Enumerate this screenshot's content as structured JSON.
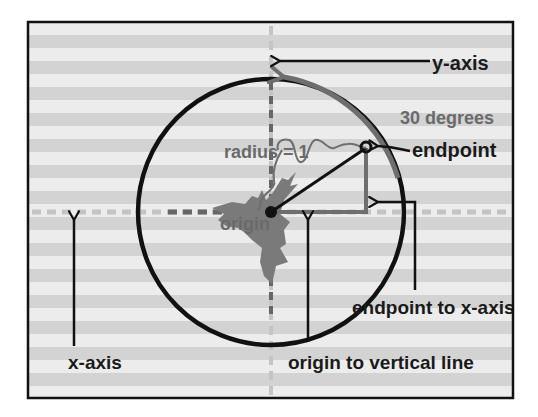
{
  "diagram": {
    "colors": {
      "stripe_light": "#ececec",
      "stripe_dark": "#d3d3d3",
      "border": "#111111",
      "circle": "#111111",
      "accent_gray": "#6e6e6e",
      "axis_dash_light": "#c4c4c4",
      "label_dark": "#1a1a1a",
      "label_gray": "#6a6a6a"
    },
    "angle_degrees": 30,
    "radius_value": 1,
    "labels": {
      "y_axis": "y-axis",
      "x_axis": "x-axis",
      "angle": "30 degrees",
      "radius": "radius = 1",
      "endpoint": "endpoint",
      "origin": "origin",
      "endpoint_to_x_axis": "endpoint to x-axis",
      "origin_to_vertical_line": "origin to vertical line"
    },
    "icons": {
      "arrow": "arrow-icon",
      "origin_dot": "dot-icon",
      "endpoint_dot": "dot-icon"
    }
  }
}
